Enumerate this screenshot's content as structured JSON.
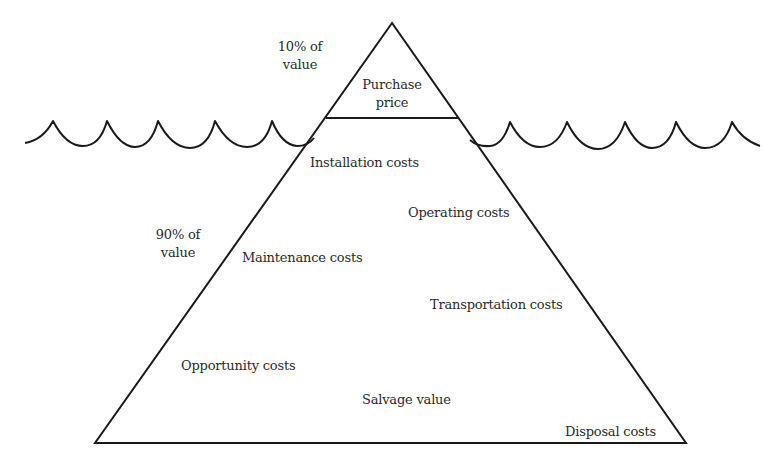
{
  "diagram": {
    "type": "iceberg",
    "title": "",
    "colors": {
      "stroke": "#1a1a1a",
      "text": "#2a2a2a",
      "background": "#ffffff"
    },
    "above_water": {
      "share_label_line1": "10% of",
      "share_label_line2": "value",
      "items": [
        {
          "line1": "Purchase",
          "line2": "price"
        }
      ]
    },
    "below_water": {
      "share_label_line1": "90% of",
      "share_label_line2": "value",
      "items": [
        {
          "label": "Installation costs"
        },
        {
          "label": "Operating costs"
        },
        {
          "label": "Maintenance costs"
        },
        {
          "label": "Transportation costs"
        },
        {
          "label": "Opportunity costs"
        },
        {
          "label": "Salvage value"
        },
        {
          "label": "Disposal costs"
        }
      ]
    }
  }
}
